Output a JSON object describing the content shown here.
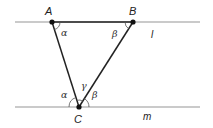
{
  "diagram": {
    "type": "geometry-parallel-lines-triangle",
    "colors": {
      "parallel_line": "#b8b8b8",
      "triangle_edge": "#222222",
      "vertex_dot": "#111111",
      "text": "#222222"
    },
    "lines": [
      {
        "name": "l",
        "label": "l",
        "y": 22
      },
      {
        "name": "m",
        "label": "m",
        "y": 107
      }
    ],
    "points": {
      "A": {
        "label": "A",
        "x": 52,
        "y": 22
      },
      "B": {
        "label": "B",
        "x": 133,
        "y": 22
      },
      "C": {
        "label": "C",
        "x": 79,
        "y": 107
      }
    },
    "angles": {
      "A_alpha": "α",
      "B_beta": "β",
      "C_alpha": "α",
      "C_gamma": "γ",
      "C_beta": "β"
    }
  }
}
